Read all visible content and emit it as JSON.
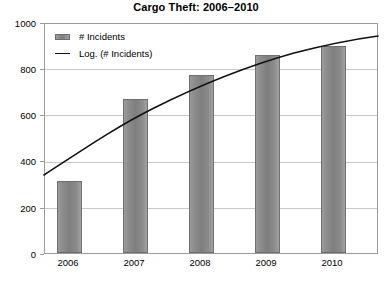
{
  "chart_data": {
    "type": "bar",
    "title": "Cargo Theft: 2006–2010",
    "xlabel": "",
    "ylabel": "",
    "categories": [
      "2006",
      "2007",
      "2008",
      "2009",
      "2010"
    ],
    "values": [
      310,
      668,
      770,
      858,
      895
    ],
    "ylim": [
      0,
      1000
    ],
    "yticks": [
      "0",
      "200",
      "400",
      "600",
      "800",
      "1000"
    ],
    "grid": true,
    "legend_position": "top-left",
    "series": [
      {
        "name": "# Incidents",
        "type": "bar",
        "values": [
          310,
          668,
          770,
          858,
          895
        ],
        "color": "#8d8d8d"
      },
      {
        "name": "Log. (# Incidents)",
        "type": "line",
        "fit": "logarithmic",
        "color": "#111111",
        "endpoint_values": [
          342,
          945
        ]
      }
    ],
    "legend": [
      {
        "label": "# Incidents",
        "marker": "bar-swatch"
      },
      {
        "label": "Log. (# Incidents)",
        "marker": "line-swatch"
      }
    ]
  },
  "axes": {
    "y": {
      "ticks": [
        {
          "label": "1000",
          "value": 1000
        },
        {
          "label": "800",
          "value": 800
        },
        {
          "label": "600",
          "value": 600
        },
        {
          "label": "400",
          "value": 400
        },
        {
          "label": "200",
          "value": 200
        },
        {
          "label": "0",
          "value": 0
        }
      ]
    },
    "x": {
      "ticks": [
        {
          "label": "2006"
        },
        {
          "label": "2007"
        },
        {
          "label": "2008"
        },
        {
          "label": "2009"
        },
        {
          "label": "2010"
        }
      ]
    }
  }
}
